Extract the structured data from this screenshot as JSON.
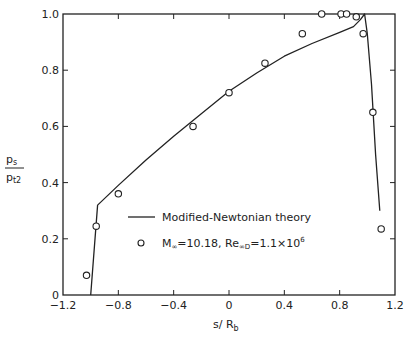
{
  "chart_data": {
    "type": "line",
    "title": "",
    "xlabel": "s/R_b",
    "ylabel": "p_s/p_t2",
    "xlabel_parts": {
      "main": "s/ R",
      "sub": "b"
    },
    "ylabel_parts": {
      "num": "p",
      "num_sub": "s",
      "den": "p",
      "den_sub": "t2"
    },
    "xlim": [
      -1.2,
      1.2
    ],
    "ylim": [
      0,
      1.0
    ],
    "xticks": [
      -1.2,
      -0.8,
      -0.4,
      0,
      0.4,
      0.8,
      1.2
    ],
    "xtick_labels": [
      "-1.2",
      "-0.8",
      "-0.4",
      "0",
      "0.4",
      "0.8",
      "1.2"
    ],
    "yticks": [
      0,
      0.2,
      0.4,
      0.6,
      0.8,
      1.0
    ],
    "ytick_labels": [
      "0",
      "0.2",
      "0.4",
      "0.6",
      "0.8",
      "1.0"
    ],
    "grid": false,
    "legend_position": "lower center (inside plot)",
    "series": [
      {
        "name": "Modified-Newtonian theory",
        "style": "line",
        "x": [
          -1.0,
          -0.95,
          -0.8,
          -0.6,
          -0.4,
          -0.2,
          0.0,
          0.2,
          0.4,
          0.6,
          0.8,
          0.9,
          0.95,
          0.98,
          1.0,
          1.03,
          1.06,
          1.09
        ],
        "y": [
          0.0,
          0.32,
          0.39,
          0.48,
          0.565,
          0.645,
          0.725,
          0.79,
          0.85,
          0.895,
          0.935,
          0.955,
          0.98,
          1.0,
          0.93,
          0.75,
          0.5,
          0.3
        ]
      },
      {
        "name": "M∞=10.18, Re∞D=1.1×10^6",
        "style": "marker-open-circle",
        "x": [
          -1.03,
          -0.96,
          -0.8,
          -0.26,
          0.0,
          0.26,
          0.53,
          0.67,
          0.81,
          0.85,
          0.92,
          0.97,
          1.04,
          1.1
        ],
        "y": [
          0.07,
          0.245,
          0.36,
          0.6,
          0.72,
          0.825,
          0.93,
          1.0,
          1.0,
          1.0,
          0.99,
          0.93,
          0.65,
          0.235
        ]
      }
    ],
    "legend": [
      {
        "label": "Modified-Newtonian theory",
        "marker": "line"
      },
      {
        "label_parts": [
          "M",
          "∞",
          "=10.18, Re",
          "∞D",
          "=1.1×10",
          "6"
        ],
        "marker": "open-circle"
      }
    ]
  },
  "colors": {
    "ink": "#222222",
    "background": "#ffffff"
  }
}
